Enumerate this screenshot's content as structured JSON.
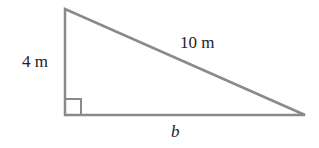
{
  "diagram": {
    "type": "right-triangle",
    "labels": {
      "height": "4 m",
      "hypotenuse": "10 m",
      "base": "b"
    },
    "colors": {
      "stroke": "#8a8a8a",
      "text": "#222222",
      "background": "#ffffff"
    }
  }
}
